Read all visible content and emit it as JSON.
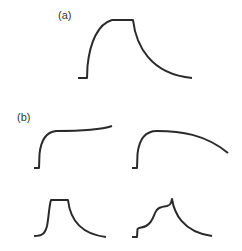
{
  "figure": {
    "panel_labels": {
      "a": "(a)",
      "b": "(b)"
    },
    "stroke_color": "#2a2a2a",
    "curves": [
      {
        "panel": "a",
        "description": "rise to plateau then exponential decay"
      },
      {
        "panel": "b",
        "description": "rapid rise then slow continued increase"
      },
      {
        "panel": "b",
        "description": "rapid rise then gradual decline"
      },
      {
        "panel": "b",
        "description": "rise to short plateau then decay"
      },
      {
        "panel": "b",
        "description": "stepwise rise to peak then decay"
      }
    ]
  }
}
